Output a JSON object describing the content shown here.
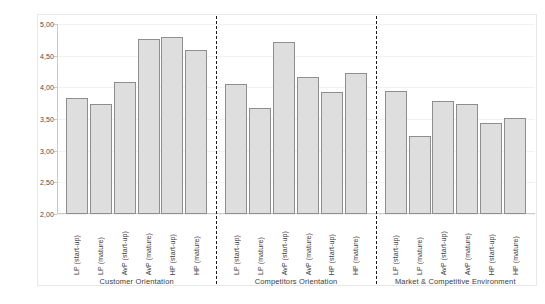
{
  "chart_data": {
    "type": "bar",
    "title": "",
    "subtitle": "",
    "xlabel": "",
    "ylabel": "",
    "ylim": [
      2.0,
      5.0
    ],
    "grid": true,
    "legend": "none",
    "decimal_separator": ",",
    "ytick_labels": [
      "5,00",
      "4,50",
      "4,00",
      "3,50",
      "3,00",
      "2,50",
      "2,00"
    ],
    "ytick_values": [
      5.0,
      4.5,
      4.0,
      3.5,
      3.0,
      2.5,
      2.0
    ],
    "categories": [
      "LP (start-up)",
      "LP (mature)",
      "AvP (start-up)",
      "AvP (mature)",
      "HP (start-up)",
      "HP (mature)"
    ],
    "groups": [
      {
        "name": "Customer Orientation",
        "categories": [
          "LP (start-up)",
          "LP (mature)",
          "AvP (start-up)",
          "AvP (mature)",
          "HP (start-up)",
          "HP (mature)"
        ],
        "values": [
          3.83,
          3.73,
          4.08,
          4.77,
          4.79,
          4.59
        ]
      },
      {
        "name": "Competitors Orientation",
        "categories": [
          "LP (start-up)",
          "LP (mature)",
          "AvP (start-up)",
          "AvP (mature)",
          "HP (start-up)",
          "HP (mature)"
        ],
        "values": [
          4.05,
          3.68,
          4.72,
          4.17,
          3.92,
          4.22
        ]
      },
      {
        "name": "Market & Competitive Environment",
        "categories": [
          "LP (start-up)",
          "LP (mature)",
          "AvP (start-up)",
          "AvP (mature)",
          "HP (start-up)",
          "HP (mature)"
        ],
        "values": [
          3.94,
          3.23,
          3.79,
          3.73,
          3.43,
          3.52
        ]
      }
    ],
    "colors": {
      "bar_fill": "#dedede",
      "bar_border": "#8e8e8e",
      "axis": "#c9c9c9",
      "grid": "#f2f2f2",
      "separator": "#1a1a1a",
      "text": "#3c3c3c",
      "background": "#ffffff"
    }
  }
}
